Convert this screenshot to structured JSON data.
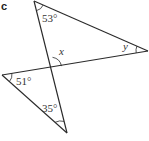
{
  "figure": {
    "part_label": "c",
    "angles": {
      "top": "53°",
      "right": "y",
      "intersection": "x",
      "left": "51°",
      "bottom": "35°"
    }
  },
  "geometry": {
    "vertices": {
      "top": [
        34,
        1
      ],
      "right": [
        148,
        51
      ],
      "left": [
        2,
        75
      ],
      "bottom": [
        67,
        133
      ],
      "intersection": [
        50,
        68
      ]
    },
    "description": "Two triangles sharing a vertex at the intersection of two crossing line segments"
  }
}
